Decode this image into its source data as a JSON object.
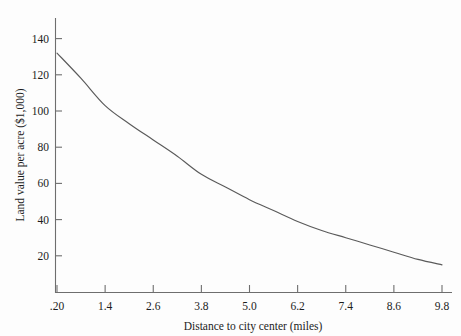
{
  "chart_data": {
    "type": "line",
    "title": "",
    "xlabel": "Distance to city center (miles)",
    "ylabel": "Land value per acre ($1,000)",
    "xlim": [
      0.2,
      9.8
    ],
    "ylim": [
      0,
      148
    ],
    "grid": false,
    "legend": "none",
    "xticklabels": [
      ".20",
      "1.4",
      "2.6",
      "3.8",
      "5.0",
      "6.2",
      "7.4",
      "8.6",
      "9.8"
    ],
    "xtickvalues": [
      0.2,
      1.4,
      2.6,
      3.8,
      5.0,
      6.2,
      7.4,
      8.6,
      9.8
    ],
    "yticklabels": [
      "20",
      "40",
      "60",
      "80",
      "100",
      "120",
      "140"
    ],
    "ytickvalues": [
      20,
      40,
      60,
      80,
      100,
      120,
      140
    ],
    "series": [
      {
        "name": "Land value",
        "x": [
          0.2,
          0.8,
          1.4,
          2.0,
          2.6,
          3.2,
          3.8,
          4.4,
          5.0,
          5.6,
          6.2,
          6.8,
          7.4,
          8.0,
          8.6,
          9.2,
          9.8
        ],
        "values": [
          132,
          118,
          103,
          93,
          84,
          75,
          65,
          58,
          51,
          45,
          39,
          34,
          30,
          26,
          22,
          18,
          15
        ]
      }
    ],
    "curve_color": "#5a5a5a",
    "axis_color": "#6e6e6e",
    "background_color": "#fdfdfd"
  },
  "geometry": {
    "plot_left": 55,
    "plot_right": 452,
    "plot_top": 18,
    "plot_bottom": 293,
    "x_first_tick": 57,
    "x_last_tick": 442,
    "y_value_zero": 292,
    "y_pixels_per_20": 36.2
  }
}
